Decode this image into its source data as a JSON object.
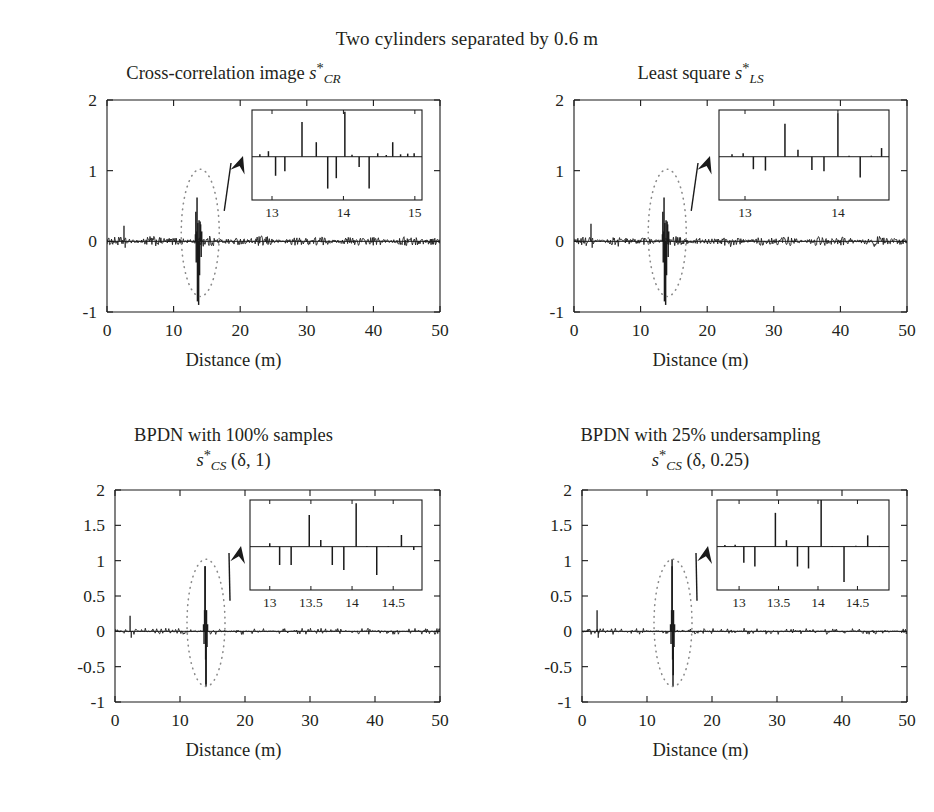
{
  "figure": {
    "suptitle": "Two cylinders separated by 0.6 m",
    "width": 934,
    "height": 812,
    "line_color": "#1a1a1a",
    "ellipse_color": "#8a8a8a",
    "background": "#ffffff"
  },
  "axis": {
    "xlabel": "Distance (m)",
    "xticks": [
      "0",
      "10",
      "20",
      "30",
      "40",
      "50"
    ],
    "xtick_values": [
      0,
      10,
      20,
      30,
      40,
      50
    ],
    "xlim": [
      0,
      50
    ],
    "yticks_top": [
      "-1",
      "0",
      "1",
      "2"
    ],
    "ytick_values_top": [
      -1,
      0,
      1,
      2
    ],
    "ylim_top": [
      -1,
      2
    ],
    "yticks_bottom": [
      "-1",
      "-0.5",
      "0",
      "0.5",
      "1",
      "1.5",
      "2"
    ],
    "ytick_values_bottom": [
      -1,
      -0.5,
      0,
      0.5,
      1,
      1.5,
      2
    ],
    "ylim_bottom": [
      -1,
      2
    ]
  },
  "panels": [
    {
      "id": "cross-correlation",
      "title_line1": "Cross-correlation image",
      "title_sym_base": "s",
      "title_sym_sup": "*",
      "title_sym_sub": "CR",
      "title_line2": "",
      "y_style": "top",
      "inset": {
        "xticks": [
          "13",
          "14",
          "15"
        ],
        "xtick_values": [
          13,
          14,
          15
        ],
        "xlim": [
          12.72,
          15.1
        ],
        "ylim": [
          -1.25,
          1.35
        ],
        "spikes": [
          [
            12.83,
            0.07
          ],
          [
            12.95,
            0.16
          ],
          [
            13.05,
            -0.55
          ],
          [
            13.18,
            -0.42
          ],
          [
            13.31,
            0.0
          ],
          [
            13.42,
            1.0
          ],
          [
            13.52,
            0.0
          ],
          [
            13.62,
            0.42
          ],
          [
            13.78,
            -0.92
          ],
          [
            13.9,
            -0.62
          ],
          [
            14.02,
            1.3
          ],
          [
            14.12,
            0.06
          ],
          [
            14.22,
            -0.3
          ],
          [
            14.36,
            -0.92
          ],
          [
            14.48,
            0.1
          ],
          [
            14.6,
            0.05
          ],
          [
            14.69,
            0.42
          ],
          [
            14.8,
            0.07
          ],
          [
            14.9,
            0.09
          ],
          [
            14.99,
            0.1
          ]
        ]
      }
    },
    {
      "id": "least-square",
      "title_line1": "Least square",
      "title_sym_base": "s",
      "title_sym_sup": "*",
      "title_sym_sub": "LS",
      "title_line2": "",
      "y_style": "top",
      "inset": {
        "xticks": [
          "13",
          "14"
        ],
        "xtick_values": [
          13,
          14
        ],
        "xlim": [
          12.72,
          14.55
        ],
        "ylim": [
          -1.25,
          1.35
        ],
        "spikes": [
          [
            12.86,
            0.07
          ],
          [
            12.98,
            0.1
          ],
          [
            13.09,
            -0.36
          ],
          [
            13.22,
            -0.4
          ],
          [
            13.43,
            0.95
          ],
          [
            13.57,
            0.2
          ],
          [
            13.72,
            -0.38
          ],
          [
            13.85,
            -0.42
          ],
          [
            14.0,
            1.25
          ],
          [
            14.12,
            0.03
          ],
          [
            14.24,
            -0.6
          ],
          [
            14.36,
            0.03
          ],
          [
            14.47,
            0.25
          ]
        ]
      }
    },
    {
      "id": "bpdn-100",
      "title_line1": "BPDN with 100% samples",
      "title_sym_base": "s",
      "title_sym_sup": "*",
      "title_sym_sub": "CS",
      "title_line2": " (δ, 1)",
      "y_style": "bottom",
      "inset": {
        "xticks": [
          "13",
          "13.5",
          "14",
          "14.5"
        ],
        "xtick_values": [
          13,
          13.5,
          14,
          14.5
        ],
        "xlim": [
          12.76,
          14.85
        ],
        "ylim": [
          -1.3,
          1.4
        ],
        "spikes": [
          [
            12.9,
            0.0
          ],
          [
            13.0,
            0.1
          ],
          [
            13.12,
            -0.55
          ],
          [
            13.26,
            -0.55
          ],
          [
            13.48,
            0.95
          ],
          [
            13.62,
            0.2
          ],
          [
            13.76,
            -0.55
          ],
          [
            13.9,
            -0.7
          ],
          [
            14.05,
            1.3
          ],
          [
            14.18,
            0.02
          ],
          [
            14.3,
            -0.85
          ],
          [
            14.44,
            0.02
          ],
          [
            14.6,
            0.35
          ],
          [
            14.75,
            -0.1
          ]
        ]
      }
    },
    {
      "id": "bpdn-25",
      "title_line1": "BPDN with 25% undersampling",
      "title_sym_base": "s",
      "title_sym_sup": "*",
      "title_sym_sub": "CS",
      "title_line2": " (δ, 0.25)",
      "y_style": "bottom",
      "inset": {
        "xticks": [
          "13",
          "13.5",
          "14",
          "14.5"
        ],
        "xtick_values": [
          13,
          13.5,
          14,
          14.5
        ],
        "xlim": [
          12.72,
          14.9
        ],
        "ylim": [
          -1.35,
          1.45
        ],
        "spikes": [
          [
            12.82,
            0.05
          ],
          [
            12.95,
            0.06
          ],
          [
            13.06,
            -0.5
          ],
          [
            13.2,
            -0.62
          ],
          [
            13.46,
            1.05
          ],
          [
            13.6,
            0.2
          ],
          [
            13.74,
            -0.62
          ],
          [
            13.88,
            -0.68
          ],
          [
            14.04,
            1.45
          ],
          [
            14.18,
            0.02
          ],
          [
            14.33,
            -1.1
          ],
          [
            14.48,
            0.03
          ],
          [
            14.63,
            0.35
          ],
          [
            14.78,
            0.02
          ]
        ]
      }
    }
  ],
  "chart_data": {
    "type": "line",
    "title": "Two cylinders separated by 0.6 m",
    "xlabel": "Distance (m)",
    "ylabel": "",
    "xlim": [
      0,
      50
    ],
    "grid": false,
    "legend": "none",
    "subplots": [
      {
        "name": "Cross-correlation image s*_CR",
        "ylim": [
          -1,
          2
        ],
        "description": "Dense oscillatory trace near zero across full range with a strong spike cluster at about 13-15 m (peaks reaching +0.95 and -0.85) and a small spike near 2.5 m",
        "main_spikes": [
          [
            2.5,
            0.22
          ],
          [
            13.55,
            0.6
          ],
          [
            13.35,
            0.42
          ],
          [
            13.75,
            -0.9
          ],
          [
            13.6,
            -0.85
          ],
          [
            14.05,
            0.25
          ]
        ],
        "annotation": "dotted ellipse at ~14 m with arrow to inset"
      },
      {
        "name": "Least square s*_LS",
        "ylim": [
          -1,
          2
        ],
        "description": "Similar dense trace; spike cluster near 13-14.5 m; small spike near 2.5 m",
        "main_spikes": [
          [
            2.5,
            0.25
          ],
          [
            13.6,
            0.52
          ],
          [
            13.35,
            0.32
          ],
          [
            13.8,
            -0.55
          ],
          [
            14.1,
            0.2
          ]
        ],
        "annotation": "dotted ellipse at ~14 m with arrow to inset"
      },
      {
        "name": "BPDN with 100% samples s*_CS (delta, 1)",
        "ylim": [
          -1,
          2
        ],
        "description": "Sparse, low-noise trace; isolated spikes at ~13.8-14.2 m reaching +0.9 and -0.75; small spike near 2.3 m",
        "main_spikes": [
          [
            2.3,
            0.22
          ],
          [
            13.85,
            0.9
          ],
          [
            14.0,
            -0.75
          ],
          [
            14.15,
            0.3
          ]
        ],
        "annotation": "dotted ellipse at ~14 m with arrow to inset"
      },
      {
        "name": "BPDN with 25% undersampling s*_CS (delta, 0.25)",
        "ylim": [
          -1,
          2
        ],
        "description": "Sparse, low-noise trace; isolated spikes at ~13.8-14.2 m reaching +1.0 and -0.6; small spike near 2.3 m",
        "main_spikes": [
          [
            2.3,
            0.3
          ],
          [
            13.85,
            1.0
          ],
          [
            14.05,
            -0.6
          ],
          [
            14.2,
            0.25
          ]
        ],
        "annotation": "dotted ellipse at ~14 m with arrow to inset"
      }
    ]
  }
}
